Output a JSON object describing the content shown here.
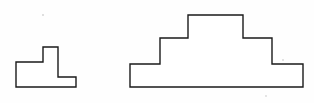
{
  "page": {
    "background_color": "#fefefe",
    "width": 314,
    "height": 103
  },
  "style": {
    "stroke_color": "#1a1a1a",
    "fill_color": "#ffffff",
    "stroke_width": 1.4
  },
  "figures": [
    {
      "id": "small-stepped-shape",
      "name": "small-two-tier-pedestal",
      "label": "",
      "description": "small two-tier stepped polygon with a narrow raised block on a wide base",
      "tiers": 2,
      "vertex_count": 8,
      "points": "16,62 43,62 43,47 58,47 58,77 76,77 76,87 16,87",
      "vertices": [
        [
          16,
          62
        ],
        [
          43,
          62
        ],
        [
          43,
          47
        ],
        [
          58,
          47
        ],
        [
          58,
          77
        ],
        [
          76,
          77
        ],
        [
          76,
          87
        ],
        [
          16,
          87
        ]
      ],
      "bounds": {
        "x": 16,
        "y": 47,
        "width": 60,
        "height": 40
      }
    },
    {
      "id": "large-stepped-shape",
      "name": "large-three-tier-pyramid",
      "label": "",
      "description": "large symmetric three-tier stepped polygon resembling a ziggurat",
      "tiers": 3,
      "vertex_count": 12,
      "points": "130,87 130,64 160,64 160,38 188,38 188,15 243,15 243,38 272,38 272,64 303,64 303,87",
      "vertices": [
        [
          130,
          87
        ],
        [
          130,
          64
        ],
        [
          160,
          64
        ],
        [
          160,
          38
        ],
        [
          188,
          38
        ],
        [
          188,
          15
        ],
        [
          243,
          15
        ],
        [
          243,
          38
        ],
        [
          272,
          38
        ],
        [
          272,
          64
        ],
        [
          303,
          64
        ],
        [
          303,
          87
        ]
      ],
      "bounds": {
        "x": 130,
        "y": 15,
        "width": 173,
        "height": 72
      }
    }
  ],
  "specks": [
    {
      "name": "speck-upper-left",
      "cx": 43,
      "cy": 15,
      "r": 1.1
    },
    {
      "name": "speck-right-mid",
      "cx": 283,
      "cy": 60,
      "r": 1.0
    },
    {
      "name": "speck-lower-right",
      "cx": 266,
      "cy": 96,
      "r": 0.9
    }
  ]
}
